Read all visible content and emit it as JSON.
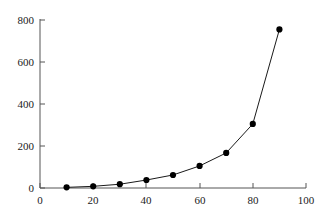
{
  "chart_data": {
    "type": "line",
    "title": "",
    "subtitle": "",
    "xlabel": "",
    "ylabel": "",
    "x": [
      10,
      20,
      30,
      40,
      50,
      60,
      70,
      80,
      90
    ],
    "values": [
      3,
      8,
      18,
      38,
      62,
      105,
      167,
      305,
      755
    ],
    "series": [
      {
        "name": "series-1",
        "x": [
          10,
          20,
          30,
          40,
          50,
          60,
          70,
          80,
          90
        ],
        "values": [
          3,
          8,
          18,
          38,
          62,
          105,
          167,
          305,
          755
        ]
      }
    ],
    "xlim": [
      0,
      100
    ],
    "ylim": [
      0,
      800
    ],
    "xticks": [
      0,
      20,
      40,
      60,
      80,
      100
    ],
    "yticks": [
      0,
      200,
      400,
      600,
      800
    ],
    "xtick_labels": [
      "0",
      "20",
      "40",
      "60",
      "80",
      "100"
    ],
    "ytick_labels": [
      "0",
      "200",
      "400",
      "600",
      "800"
    ],
    "grid": false,
    "legend": null,
    "legend_position": "none",
    "annotations": [],
    "marker": "filled-circle",
    "line_color": "#1a1a1a",
    "marker_color": "#000000",
    "axis_color": "#555555",
    "background_color": "#ffffff",
    "tick_direction": "in"
  }
}
